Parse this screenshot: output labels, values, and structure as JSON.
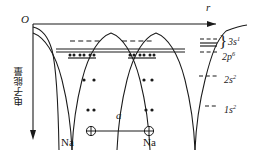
{
  "figure": {
    "axes": {
      "x_label": "r",
      "y_label": "电子能量",
      "origin_label": "O"
    },
    "lattice": {
      "spacing_label": "a",
      "atom_left_label": "Na",
      "atom_right_label": "Na",
      "nucleus_icon": "circled-plus-icon"
    },
    "legend": {
      "brace_glyph": "}",
      "items": [
        {
          "id": "3s",
          "label": "3s",
          "superscript": "1",
          "style": "band-multi-dashed"
        },
        {
          "id": "2p",
          "label": "2p",
          "superscript": "6",
          "style": "band-dashed"
        },
        {
          "id": "2s",
          "label": "2s",
          "superscript": "2",
          "style": "single-dashed"
        },
        {
          "id": "1s",
          "label": "1s",
          "superscript": "2",
          "style": "short-dashed"
        }
      ]
    },
    "levels": [
      {
        "id": "3s",
        "y": 41,
        "type": "dashed",
        "electrons_per_atom": 0
      },
      {
        "id": "3s-band",
        "y": 50,
        "type": "solid-band",
        "electrons_per_atom": 0
      },
      {
        "id": "2p",
        "y": 58,
        "type": "solid",
        "electrons_per_atom": 6
      },
      {
        "id": "2s",
        "y": 80,
        "type": "dots",
        "electrons_per_atom": 2
      },
      {
        "id": "1s",
        "y": 110,
        "type": "dots",
        "electrons_per_atom": 2
      }
    ],
    "colors": {
      "stroke": "#1a1a1a",
      "background": "#ffffff"
    }
  }
}
